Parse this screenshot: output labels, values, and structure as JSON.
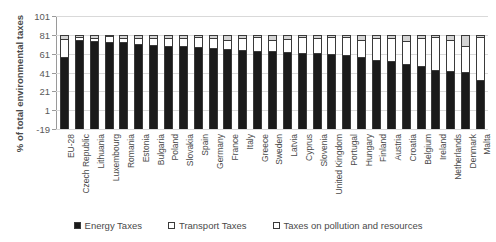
{
  "chart_data": {
    "type": "bar",
    "stacked": true,
    "title": "",
    "xlabel": "",
    "ylabel": "% of total environmental taxes",
    "ylim": [
      -19,
      101
    ],
    "yticks": [
      -19,
      1,
      21,
      41,
      61,
      81,
      101
    ],
    "grid": true,
    "legend_position": "bottom",
    "categories": [
      "EU-28",
      "Czech Republic",
      "Lithuania",
      "Luxembourg",
      "Romania",
      "Estonia",
      "Bulgaria",
      "Poland",
      "Slovakia",
      "Spain",
      "Germany",
      "France",
      "Italy",
      "Greece",
      "Sweden",
      "Latvia",
      "Cyprus",
      "Slovenia",
      "United Kingdom",
      "Portugal",
      "Hungary",
      "Finland",
      "Austria",
      "Croatia",
      "Belgium",
      "Ireland",
      "Netherlands",
      "Denmark",
      "Malta"
    ],
    "series": [
      {
        "name": "Energy Taxes",
        "color": "#1a1a1a",
        "values": [
          76.5,
          94.0,
          93.0,
          92.5,
          92.0,
          90.5,
          89.5,
          88.5,
          87.5,
          86.5,
          85.5,
          84.5,
          84.0,
          83.0,
          82.5,
          81.5,
          81.0,
          80.5,
          79.5,
          78.5,
          76.0,
          73.5,
          72.0,
          68.5,
          66.5,
          62.0,
          61.5,
          60.5,
          52.0
        ]
      },
      {
        "name": "Transport Taxes",
        "color": "#ffffff",
        "values": [
          19.5,
          3.5,
          3.5,
          6.0,
          4.5,
          6.5,
          7.5,
          8.0,
          9.5,
          11.0,
          11.0,
          10.5,
          12.5,
          15.0,
          11.5,
          14.0,
          17.0,
          16.0,
          18.0,
          19.0,
          18.0,
          23.0,
          25.0,
          25.0,
          30.0,
          36.0,
          32.5,
          28.0,
          45.5
        ]
      },
      {
        "name": "Taxes on pollution and resources",
        "color": "#d4d4d4",
        "values": [
          4.0,
          2.5,
          3.5,
          1.5,
          3.5,
          3.0,
          3.0,
          3.5,
          3.0,
          2.5,
          3.5,
          5.0,
          3.5,
          2.0,
          6.0,
          4.5,
          2.0,
          3.5,
          2.5,
          2.5,
          6.0,
          3.5,
          3.0,
          6.5,
          3.5,
          2.0,
          6.0,
          11.5,
          2.5
        ]
      }
    ]
  },
  "legend": {
    "items": [
      {
        "label": "Energy Taxes"
      },
      {
        "label": "Transport Taxes"
      },
      {
        "label": "Taxes on pollution and resources"
      }
    ]
  }
}
